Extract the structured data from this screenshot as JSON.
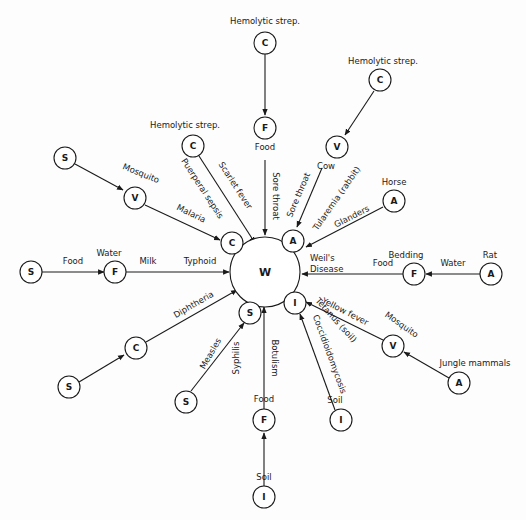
{
  "diagram": {
    "title": "",
    "center": {
      "id": "W",
      "letter": "W"
    },
    "nodes": [
      {
        "id": "c_top",
        "letter": "C",
        "label": "Hemolytic strep."
      },
      {
        "id": "f_top",
        "letter": "F",
        "label": "Food"
      },
      {
        "id": "c_tr",
        "letter": "C",
        "label": "Hemolytic strep."
      },
      {
        "id": "v_cow",
        "letter": "V",
        "label": "Cow"
      },
      {
        "id": "c_tl",
        "letter": "C",
        "label": "Hemolytic strep."
      },
      {
        "id": "a_horse",
        "letter": "A",
        "label": "Horse"
      },
      {
        "id": "a_near",
        "letter": "A",
        "label": ""
      },
      {
        "id": "c_near",
        "letter": "C",
        "label": ""
      },
      {
        "id": "s_mal",
        "letter": "S",
        "label": ""
      },
      {
        "id": "v_mal",
        "letter": "V",
        "label": "Mosquito"
      },
      {
        "id": "s_food",
        "letter": "S",
        "label": ""
      },
      {
        "id": "f_water",
        "letter": "F",
        "label": "Water"
      },
      {
        "id": "a_rat",
        "letter": "A",
        "label": "Rat"
      },
      {
        "id": "f_bed",
        "letter": "F",
        "label": "Bedding"
      },
      {
        "id": "i_near",
        "letter": "I",
        "label": ""
      },
      {
        "id": "v_yf",
        "letter": "V",
        "label": "Mosquito"
      },
      {
        "id": "a_jungle",
        "letter": "A",
        "label": "Jungle mammals"
      },
      {
        "id": "i_soil_r",
        "letter": "I",
        "label": "Soil"
      },
      {
        "id": "s_near",
        "letter": "S",
        "label": ""
      },
      {
        "id": "s_diph",
        "letter": "S",
        "label": ""
      },
      {
        "id": "c_diph",
        "letter": "C",
        "label": ""
      },
      {
        "id": "s_meas",
        "letter": "S",
        "label": ""
      },
      {
        "id": "f_bot",
        "letter": "F",
        "label": "Food"
      },
      {
        "id": "i_bot",
        "letter": "I",
        "label": "Soil"
      }
    ],
    "edges": [
      {
        "from": "c_top",
        "to": "f_top",
        "label": ""
      },
      {
        "from": "f_top",
        "to": "W",
        "label": "Sore throat"
      },
      {
        "from": "c_tr",
        "to": "v_cow",
        "label": ""
      },
      {
        "from": "v_cow",
        "to": "a_near",
        "label": "Sore throat"
      },
      {
        "from": "c_tl",
        "to": "c_near",
        "label": "Scarlet fever"
      },
      {
        "from": "c_tl",
        "to": "c_near",
        "label": "Puerperal sepsis"
      },
      {
        "from": "a_horse",
        "to": "a_near",
        "label": "Glanders"
      },
      {
        "from": "s_mal",
        "to": "v_mal",
        "label": ""
      },
      {
        "from": "v_mal",
        "to": "c_near",
        "label": "Malaria"
      },
      {
        "from": "s_food",
        "to": "f_water",
        "label": "Food"
      },
      {
        "from": "f_water",
        "to": "W",
        "label": "Milk"
      },
      {
        "from": "f_water",
        "to": "W",
        "label": "Typhoid"
      },
      {
        "from": "a_rat",
        "to": "f_bed",
        "label": "Water"
      },
      {
        "from": "f_bed",
        "to": "W",
        "label": "Food"
      },
      {
        "from": "v_yf",
        "to": "i_near",
        "label": "Yellow fever"
      },
      {
        "from": "a_jungle",
        "to": "v_yf",
        "label": ""
      },
      {
        "from": "i_soil_r",
        "to": "i_near",
        "label": "Coccidioidomycosis"
      },
      {
        "from": "s_diph",
        "to": "c_diph",
        "label": ""
      },
      {
        "from": "c_diph",
        "to": "W",
        "label": "Diphtheria"
      },
      {
        "from": "s_meas",
        "to": "s_near",
        "label": "Measles"
      },
      {
        "from": "f_bot",
        "to": "W",
        "label": "Botulism"
      },
      {
        "from": "i_bot",
        "to": "f_bot",
        "label": ""
      }
    ],
    "free_labels": {
      "tularemia": "Tularemia (rabbit)",
      "weils": [
        "Weil's",
        "Disease"
      ],
      "tetanus": "Tetanus (soil)",
      "syphilis": "Syphilis"
    }
  }
}
